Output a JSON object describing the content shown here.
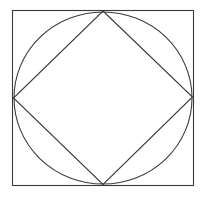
{
  "figure": {
    "background_color": "#ffffff",
    "canvas": {
      "width": 202,
      "height": 198
    },
    "stroke_color": "#3a3a3a",
    "stroke_width": 1.1,
    "shapes": {
      "outer_square": {
        "label": "outer-square",
        "x": 12.5,
        "y": 10.5,
        "width": 181,
        "height": 175,
        "left": 12.5,
        "top": 10.5,
        "right": 193.5,
        "bottom": 185.5
      },
      "inscribed_circle": {
        "label": "inscribed-circle",
        "cx": 103,
        "cy": 98,
        "rx": 89,
        "ry": 86
      },
      "inscribed_diamond": {
        "label": "inscribed-diamond",
        "points": "103,11 192.5,97 103,184.5 13.5,98",
        "vertices": [
          {
            "name": "top",
            "x": 103,
            "y": 11
          },
          {
            "name": "right",
            "x": 192.5,
            "y": 97
          },
          {
            "name": "bottom",
            "x": 103,
            "y": 184.5
          },
          {
            "name": "left",
            "x": 13.5,
            "y": 98
          }
        ]
      }
    }
  }
}
